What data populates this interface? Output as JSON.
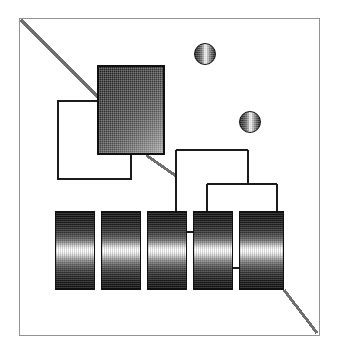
{
  "figure": {
    "style": "halftone line drawing",
    "width": 341,
    "height": 358,
    "background_color": "#ffffff",
    "stroke_color": "#1b1b1b",
    "frame_color": "#8d8d8d",
    "caption": ""
  },
  "frame": {
    "label": "outer border",
    "x": 19,
    "y": 18,
    "width": 301,
    "height": 318
  },
  "diagonals": [
    {
      "name": "top-left-diagonal",
      "x1": 21,
      "y1": 20,
      "x2": 108,
      "y2": 107,
      "color": "#6f6f6f",
      "width": 3
    },
    {
      "name": "square-tail-diagonal",
      "x1": 146,
      "y1": 155,
      "x2": 175,
      "y2": 176,
      "color": "#6f6f6f",
      "width": 3
    },
    {
      "name": "bottom-right-diagonal",
      "x1": 284,
      "y1": 290,
      "x2": 317,
      "y2": 333,
      "color": "#6f6f6f",
      "width": 3
    }
  ],
  "shapes": {
    "dark_square": {
      "label": "shaded block",
      "x": 97,
      "y": 65,
      "width": 68,
      "height": 90,
      "fill_from": "#1d1d1d",
      "fill_to": "#a2a2a2",
      "border_color": "#101010"
    },
    "outline_rect": {
      "label": "open frame",
      "x": 57,
      "y": 100,
      "width": 75,
      "height": 80,
      "border_color": "#1b1b1b",
      "fill": "#ffffff"
    }
  },
  "spheres": [
    {
      "label": "node sphere upper",
      "cx": 205,
      "cy": 54,
      "r": 11
    },
    {
      "label": "node sphere lower",
      "cx": 250,
      "cy": 122,
      "r": 11
    }
  ],
  "cylinders": [
    {
      "label": "column 1",
      "x": 55,
      "y": 211,
      "width": 40,
      "height": 79
    },
    {
      "label": "column 2",
      "x": 101,
      "y": 211,
      "width": 40,
      "height": 79
    },
    {
      "label": "column 3",
      "x": 147,
      "y": 211,
      "width": 40,
      "height": 79
    },
    {
      "label": "column 4",
      "x": 193,
      "y": 211,
      "width": 40,
      "height": 79
    },
    {
      "label": "column 5",
      "x": 239,
      "y": 211,
      "width": 45,
      "height": 79
    }
  ],
  "tree": {
    "label": "bracket connectors",
    "upper_bracket": {
      "x1": 176,
      "x2": 248,
      "y": 150,
      "drop_left": 211,
      "drop_right": 211
    },
    "lower_bracket": {
      "x1": 207,
      "x2": 277,
      "y": 184,
      "drop_left": 211,
      "drop_right": 211
    },
    "riser": {
      "x": 248,
      "y1": 150,
      "y2": 184
    },
    "stubs": [
      {
        "label": "stub 3-4",
        "x1": 183,
        "x2": 199,
        "y": 232
      },
      {
        "label": "stub 4-5",
        "x1": 229,
        "x2": 245,
        "y": 268
      }
    ]
  }
}
